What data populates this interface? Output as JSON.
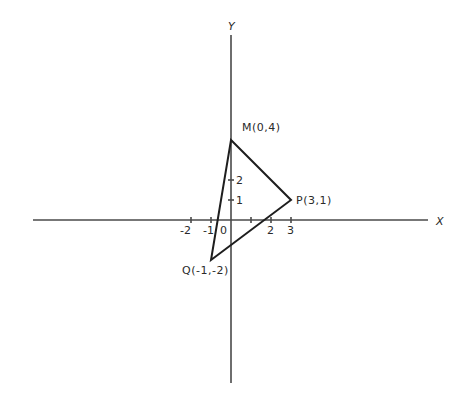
{
  "axes": {
    "x_label": "X",
    "y_label": "Y",
    "x_ticks": [
      {
        "value": -2,
        "label": "-2"
      },
      {
        "value": -1,
        "label": "-1"
      },
      {
        "value": 0,
        "label": "0"
      },
      {
        "value": 1,
        "label": ""
      },
      {
        "value": 2,
        "label": "2"
      },
      {
        "value": 3,
        "label": "3"
      }
    ],
    "y_ticks": [
      {
        "value": 1,
        "label": "1"
      },
      {
        "value": 2,
        "label": "2"
      }
    ]
  },
  "triangle": {
    "vertices": [
      {
        "name": "M",
        "x": 0,
        "y": 4,
        "label": "M(0,4)"
      },
      {
        "name": "P",
        "x": 3,
        "y": 1,
        "label": "P(3,1)"
      },
      {
        "name": "Q",
        "x": -1,
        "y": -2,
        "label": "Q(-1,-2)"
      }
    ]
  },
  "labels": {
    "M": "M(0,4)",
    "P": "P(3,1)",
    "Q": "Q(-1,-2)",
    "x_axis": "X",
    "y_axis": "Y",
    "x_tick_neg2": "-2",
    "x_tick_neg1": "-1",
    "x_tick_0": "0",
    "x_tick_2": "2",
    "x_tick_3": "3",
    "y_tick_1": "1",
    "y_tick_2": "2"
  },
  "colors": {
    "axis": "#4a4a4a",
    "edge": "#1e1e1e",
    "text": "#2a2a2a",
    "background": "#ffffff"
  }
}
